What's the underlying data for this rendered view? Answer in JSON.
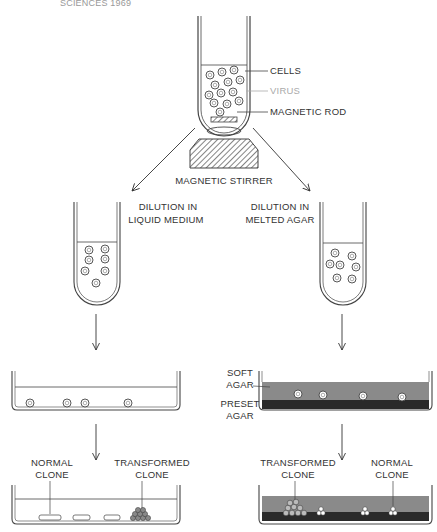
{
  "header": {
    "text": "SCIENCES 1969"
  },
  "top_tube": {
    "labels": {
      "cells": "CELLS",
      "virus": "VIRUS",
      "rod": "MAGNETIC ROD"
    },
    "stirrer_label": "MAGNETIC STIRRER"
  },
  "left_branch": {
    "tube_label_line1": "DILUTION IN",
    "tube_label_line2": "LIQUID MEDIUM",
    "final_labels": {
      "normal_line1": "NORMAL",
      "normal_line2": "CLONE",
      "transformed_line1": "TRANSFORMED",
      "transformed_line2": "CLONE"
    }
  },
  "right_branch": {
    "tube_label_line1": "DILUTION IN",
    "tube_label_line2": "MELTED AGAR",
    "dish_labels": {
      "soft_line1": "SOFT",
      "soft_line2": "AGAR",
      "preset_line1": "PRESET",
      "preset_line2": "AGAR"
    },
    "final_labels": {
      "transformed_line1": "TRANSFORMED",
      "transformed_line2": "CLONE",
      "normal_line1": "NORMAL",
      "normal_line2": "CLONE"
    }
  },
  "colors": {
    "line": "#444444",
    "soft_agar": "#8a8a8a",
    "preset_agar": "#2a2a2a",
    "virus": "#aaaaaa"
  }
}
